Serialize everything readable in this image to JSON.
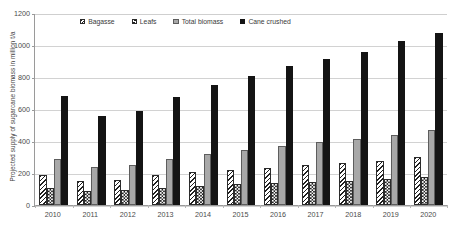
{
  "chart_data": {
    "type": "bar",
    "title": "",
    "xlabel": "",
    "ylabel": "Projected supply of sugarcane biomass in million t/a",
    "ylim": [
      0,
      1200
    ],
    "yticks": [
      0,
      200,
      400,
      600,
      800,
      1000,
      1200
    ],
    "grid": true,
    "legend_position": "top-left-inside",
    "categories": [
      "2010",
      "2011",
      "2012",
      "2013",
      "2014",
      "2015",
      "2016",
      "2017",
      "2018",
      "2019",
      "2020"
    ],
    "series": [
      {
        "name": "Bagasse",
        "pattern": "diagonal-hatch",
        "color": "#1f1f1f",
        "values": [
          185,
          151,
          158,
          185,
          204,
          219,
          234,
          247,
          261,
          277,
          297
        ]
      },
      {
        "name": "Leafs",
        "pattern": "checkerboard",
        "color": "#1f1f1f",
        "values": [
          107,
          89,
          93,
          109,
          120,
          129,
          138,
          145,
          153,
          163,
          175
        ]
      },
      {
        "name": "Total biomass",
        "pattern": "solid-gray",
        "color": "#a8a8a8",
        "values": [
          290,
          238,
          250,
          288,
          320,
          345,
          371,
          393,
          412,
          437,
          467
        ]
      },
      {
        "name": "Cane crushed",
        "pattern": "solid-black",
        "color": "#141414",
        "values": [
          684,
          555,
          588,
          672,
          747,
          809,
          866,
          913,
          958,
          1023,
          1078
        ]
      }
    ]
  },
  "axis": {
    "y_title": "Projected supply of sugarcane biomass in million t/a",
    "y_tick_labels": [
      "1200",
      "1000",
      "800",
      "600",
      "400",
      "200",
      "0"
    ],
    "x_tick_labels": [
      "2010",
      "2011",
      "2012",
      "2013",
      "2014",
      "2015",
      "2016",
      "2017",
      "2018",
      "2019",
      "2020"
    ]
  },
  "legend": {
    "items": [
      {
        "label": "Bagasse",
        "swatch": "bagasse-swatch-icon"
      },
      {
        "label": "Leafs",
        "swatch": "leafs-swatch-icon"
      },
      {
        "label": "Total biomass",
        "swatch": "total-biomass-swatch-icon"
      },
      {
        "label": "Cane crushed",
        "swatch": "cane-crushed-swatch-icon"
      }
    ]
  }
}
